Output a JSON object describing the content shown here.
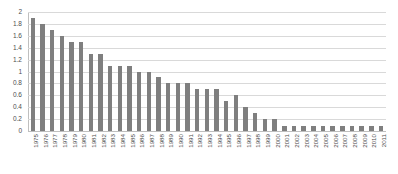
{
  "chart_data": {
    "type": "bar",
    "title": "",
    "subtitle": "",
    "xlabel": "",
    "ylabel": "",
    "ylim": [
      0,
      2
    ],
    "ytick_step": 0.2,
    "yticks": [
      "0",
      "0.2",
      "0.4",
      "0.6",
      "0.8",
      "1",
      "1.2",
      "1.4",
      "1.6",
      "1.8",
      "2"
    ],
    "grid": true,
    "legend": false,
    "legend_position": "none",
    "bar_color": "#7f7f7f",
    "gridline_color": "#d9d9d9",
    "axis_color": "#bfbfbf",
    "tick_label_color": "#4d4d4d",
    "x_label_rotation": -90,
    "categories": [
      "1975",
      "1976",
      "1977",
      "1978",
      "1979",
      "1980",
      "1981",
      "1982",
      "1983",
      "1984",
      "1985",
      "1986",
      "1987",
      "1988",
      "1989",
      "1990",
      "1991",
      "1992",
      "1993",
      "1994",
      "1995",
      "1996",
      "1997",
      "1998",
      "1999",
      "2000",
      "2001",
      "2002",
      "2003",
      "2004",
      "2005",
      "2006",
      "2007",
      "2008",
      "2009",
      "2010",
      "2011"
    ],
    "values": [
      1.9,
      1.8,
      1.7,
      1.6,
      1.5,
      1.5,
      1.3,
      1.3,
      1.1,
      1.1,
      1.1,
      1.0,
      1.0,
      0.9,
      0.8,
      0.8,
      0.8,
      0.7,
      0.7,
      0.7,
      0.5,
      0.6,
      0.4,
      0.3,
      0.2,
      0.2,
      0.08,
      0.08,
      0.08,
      0.08,
      0.08,
      0.08,
      0.08,
      0.08,
      0.08,
      0.08,
      0.08
    ]
  }
}
